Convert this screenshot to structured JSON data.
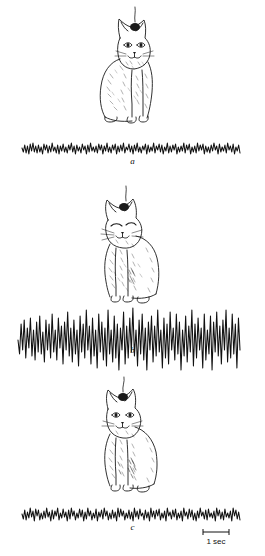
{
  "figure": {
    "background_color": "#ffffff",
    "ink_color": "#111111",
    "panels": [
      {
        "id": "a",
        "label": "a",
        "state": "alert waking",
        "cat": {
          "name": "alert-cat",
          "eyes": "open",
          "posture": "sitting upright, head raised",
          "electrode": "head electrode wire"
        },
        "trace": {
          "name": "eeg-trace-a",
          "pattern": "low-voltage fast activity",
          "amplitude": 6,
          "x_start": 22,
          "x_end": 240,
          "baseline": 18
        }
      },
      {
        "id": "b",
        "label": "b",
        "state": "drowsy / slow-wave sleep",
        "cat": {
          "name": "drowsy-cat",
          "eyes": "closed",
          "posture": "sitting, head drooping forward",
          "electrode": "head electrode wire"
        },
        "trace": {
          "name": "eeg-trace-b",
          "pattern": "high-voltage slow waves with spindles",
          "amplitude": 26,
          "x_start": 18,
          "x_end": 240,
          "baseline": 38
        }
      },
      {
        "id": "c",
        "label": "c",
        "state": "aroused waking",
        "cat": {
          "name": "aroused-cat",
          "eyes": "open",
          "posture": "sitting upright, alert",
          "electrode": "head electrode wire"
        },
        "trace": {
          "name": "eeg-trace-c",
          "pattern": "low-voltage fast activity",
          "amplitude": 7,
          "x_start": 22,
          "x_end": 240,
          "baseline": 18
        }
      }
    ],
    "scale_bar": {
      "label": "1 sec",
      "length_px": 26,
      "position": "below trace c, right side"
    }
  },
  "chart_data": {
    "type": "line",
    "title": "",
    "xlabel": "",
    "ylabel": "",
    "legend": [],
    "grid": false,
    "axis_ranges": {
      "x": [
        0,
        218
      ],
      "y": [
        -30,
        30
      ]
    },
    "scale_bar": {
      "label": "1 sec",
      "length_px": 26
    },
    "series": [
      {
        "name": "a",
        "description": "EEG, alert waking cat: low-voltage fast activity",
        "mean_amplitude_px": 6,
        "dominant_frequency": "fast / desynchronized",
        "values": [
          0,
          -4,
          3,
          -5,
          2,
          -6,
          4,
          -3,
          5,
          -4,
          2,
          -5,
          3,
          -4,
          1,
          -6,
          4,
          -2,
          3,
          -5,
          2,
          -4,
          5,
          -3,
          1,
          -5,
          3,
          -6,
          2,
          -3,
          4,
          -4,
          1,
          -5,
          3,
          -2,
          5,
          -4,
          2,
          -6,
          3,
          -3,
          1,
          -5,
          4,
          -2,
          2,
          -6,
          3,
          -4,
          5,
          -3,
          1,
          -4,
          2,
          -5,
          4,
          -2,
          3,
          -6,
          2,
          -3,
          5,
          -4,
          1,
          -5,
          3,
          -2,
          4,
          -6,
          2,
          -4,
          3,
          -3,
          5,
          -5,
          1,
          -2,
          4,
          -4,
          2,
          -6,
          3,
          -3,
          5,
          -4,
          1,
          -5,
          2,
          -2,
          4,
          -6,
          3,
          -4,
          1,
          -3,
          5,
          -5,
          2,
          -2,
          4,
          -4,
          3,
          -6,
          1,
          -3,
          5,
          -5,
          2,
          -4,
          3,
          -2,
          4,
          -6,
          1,
          -4,
          2,
          -3,
          5,
          -5,
          3,
          -2,
          4,
          -6,
          1,
          -4,
          2,
          -5,
          5,
          -3,
          3,
          -2,
          4,
          -6,
          2,
          -4,
          1,
          -5,
          3,
          -3,
          5,
          -2,
          2,
          -6,
          4,
          -4,
          1,
          -3,
          3,
          -5,
          5,
          -2,
          2,
          -4,
          4,
          -6,
          1,
          -3,
          3,
          -5
        ]
      },
      {
        "name": "b",
        "description": "EEG, drowsy / slow-wave sleep cat: high-voltage slow waves and spindle bursts",
        "mean_amplitude_px": 26,
        "dominant_frequency": "slow / synchronized",
        "values": [
          0,
          -14,
          16,
          -10,
          20,
          -18,
          12,
          -8,
          22,
          -16,
          10,
          -20,
          18,
          -12,
          24,
          -14,
          8,
          -22,
          20,
          -10,
          16,
          -18,
          26,
          -12,
          10,
          -20,
          22,
          -8,
          14,
          -24,
          18,
          -10,
          28,
          -16,
          12,
          -22,
          20,
          -14,
          10,
          -26,
          24,
          -12,
          16,
          -18,
          30,
          -10,
          14,
          -24,
          22,
          -16,
          10,
          -28,
          26,
          -12,
          18,
          -20,
          12,
          -26,
          30,
          -14,
          10,
          -22,
          24,
          -18,
          16,
          -30,
          12,
          -10,
          28,
          -24,
          14,
          -18,
          22,
          -12,
          32,
          -16,
          10,
          -26,
          20,
          -14,
          26,
          -20,
          12,
          -30,
          18,
          -10,
          24,
          -22,
          14,
          -16,
          30,
          -12,
          10,
          -28,
          22,
          -18,
          16,
          -24,
          28,
          -10,
          12,
          -20,
          26,
          -14,
          18,
          -30,
          10,
          -16,
          24,
          -22,
          14,
          -12,
          30,
          -26,
          16,
          -18,
          22,
          -10,
          12,
          -28,
          26,
          -20,
          10,
          -14,
          24,
          -30,
          18,
          -12,
          28,
          -16,
          14,
          -24,
          20,
          -10,
          30,
          -22,
          12,
          -18,
          26,
          -14,
          16,
          -28,
          22,
          -10
        ]
      },
      {
        "name": "c",
        "description": "EEG, aroused waking cat: low-voltage fast activity",
        "mean_amplitude_px": 7,
        "dominant_frequency": "fast / desynchronized",
        "values": [
          0,
          -5,
          4,
          -6,
          2,
          -4,
          6,
          -3,
          3,
          -7,
          5,
          -2,
          4,
          -6,
          1,
          -5,
          3,
          -4,
          6,
          -3,
          2,
          -7,
          4,
          -5,
          3,
          -2,
          6,
          -6,
          1,
          -4,
          5,
          -3,
          2,
          -7,
          4,
          -5,
          6,
          -2,
          3,
          -6,
          1,
          -4,
          5,
          -3,
          4,
          -7,
          2,
          -5,
          6,
          -2,
          3,
          -6,
          1,
          -4,
          5,
          -7,
          2,
          -3,
          4,
          -5,
          6,
          -2,
          3,
          -6,
          1,
          -5,
          4,
          -4,
          2,
          -7,
          6,
          -3,
          5,
          -2,
          3,
          -6,
          1,
          -4,
          4,
          -5,
          2,
          -7,
          6,
          -3,
          3,
          -5,
          5,
          -2,
          1,
          -6,
          4,
          -4,
          2,
          -7,
          6,
          -3,
          3,
          -5,
          4,
          -2,
          5,
          -6,
          1,
          -4,
          3,
          -7,
          6,
          -2,
          2,
          -5,
          4,
          -3,
          5,
          -6,
          1,
          -4,
          3,
          -7,
          6,
          -2,
          2,
          -5,
          5,
          -3,
          4,
          -6,
          1,
          -7,
          3,
          -4,
          6,
          -2,
          2,
          -5,
          4,
          -6,
          5,
          -3,
          1,
          -4,
          3,
          -7,
          6,
          -2,
          4,
          -5,
          2,
          -6,
          5,
          -3,
          1,
          -4,
          3,
          -7,
          6,
          -2,
          4,
          -5,
          2,
          -6
        ]
      }
    ]
  }
}
